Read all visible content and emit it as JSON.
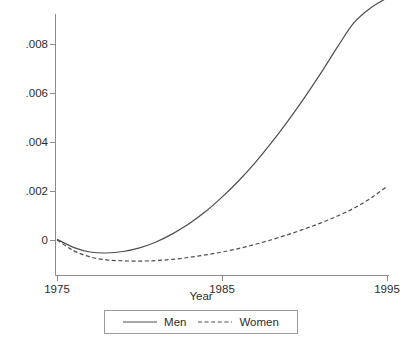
{
  "chart_data": {
    "type": "line",
    "title": "",
    "subtitle": "",
    "xlabel": "Year",
    "ylabel": "",
    "xlim": [
      1975,
      1995
    ],
    "ylim": [
      -0.0014,
      0.0104
    ],
    "xticks": [
      1975,
      1985,
      1995
    ],
    "xtick_labels": [
      "1975",
      "1985",
      "1995"
    ],
    "yticks": [
      0,
      0.002,
      0.004,
      0.006,
      0.008,
      0.01
    ],
    "ytick_labels": [
      "0",
      ".002",
      ".004",
      ".006",
      ".008",
      ".01"
    ],
    "grid": false,
    "legend_position": "bottom-center",
    "x": [
      1975,
      1976,
      1977,
      1978,
      1979,
      1980,
      1981,
      1982,
      1983,
      1984,
      1985,
      1986,
      1987,
      1988,
      1989,
      1990,
      1991,
      1992,
      1993,
      1994,
      1995
    ],
    "series": [
      {
        "name": "Men",
        "style": "solid",
        "color": "#4d4d4d",
        "values": [
          3e-05,
          -0.0003,
          -0.00049,
          -0.00053,
          -0.00047,
          -0.00032,
          -8e-05,
          0.00025,
          0.00066,
          0.00116,
          0.00175,
          0.00241,
          0.00315,
          0.00397,
          0.00486,
          0.00581,
          0.00682,
          0.00788,
          0.00887,
          0.00947,
          0.00988
        ]
      },
      {
        "name": "Women",
        "style": "dashed",
        "color": "#4d4d4d",
        "values": [
          0.0,
          -0.00043,
          -0.00069,
          -0.00081,
          -0.00085,
          -0.00086,
          -0.00084,
          -0.00079,
          -0.00071,
          -0.00061,
          -0.00049,
          -0.00035,
          -0.00018,
          1e-05,
          0.00022,
          0.00045,
          0.0007,
          0.00098,
          0.0013,
          0.0017,
          0.00219
        ]
      }
    ]
  },
  "axis": {
    "x_title": "Year"
  },
  "legend": {
    "items": [
      {
        "label": "Men",
        "style": "solid"
      },
      {
        "label": "Women",
        "style": "dashed"
      }
    ]
  }
}
